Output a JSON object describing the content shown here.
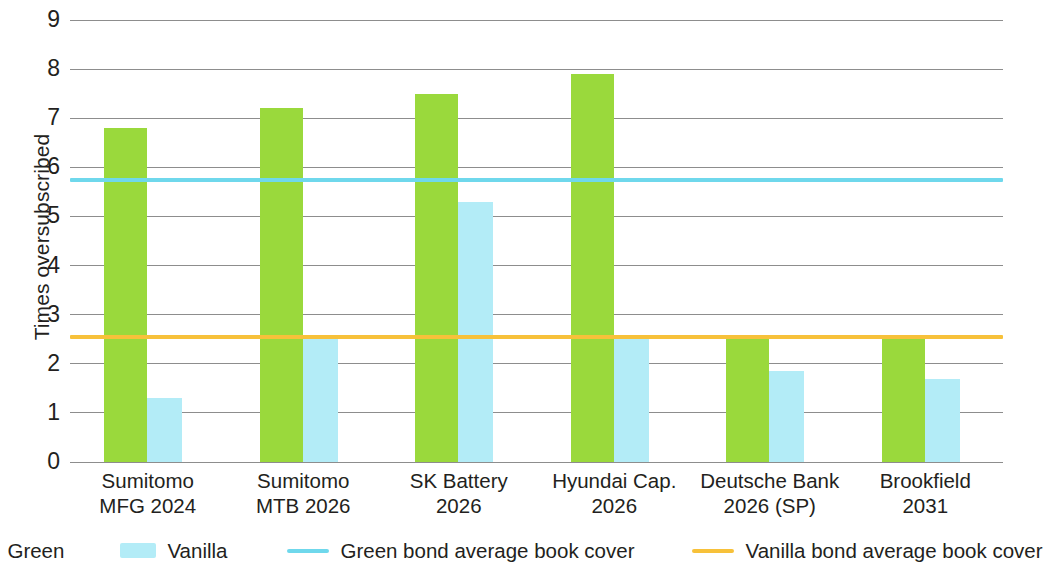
{
  "chart_data": {
    "type": "bar",
    "title": "",
    "subtitle": "",
    "xlabel": "",
    "ylabel": "Times oversubscribed",
    "ylim": [
      0,
      9
    ],
    "ytick_labels": [
      "0",
      "1",
      "2",
      "3",
      "4",
      "5",
      "6",
      "7",
      "8",
      "9"
    ],
    "yticks": [
      0,
      1,
      2,
      3,
      4,
      5,
      6,
      7,
      8,
      9
    ],
    "grid": true,
    "grid_axis": "y",
    "legend_position": "bottom",
    "categories": [
      "Sumitomo MFG 2024",
      "Sumitomo MTB 2026",
      "SK Battery 2026",
      "Hyundai Cap. 2026",
      "Deutsche Bank 2026 (SP)",
      "Brookfield 2031"
    ],
    "category_lines": [
      [
        "Sumitomo",
        "MFG 2024"
      ],
      [
        "Sumitomo",
        "MTB 2026"
      ],
      [
        "SK Battery",
        "2026"
      ],
      [
        "Hyundai Cap.",
        "2026"
      ],
      [
        "Deutsche Bank",
        "2026 (SP)"
      ],
      [
        "Brookfield",
        "2031"
      ]
    ],
    "series": [
      {
        "name": "Green",
        "color": "#9ad93c",
        "type": "bar",
        "values": [
          6.8,
          7.2,
          7.5,
          7.9,
          2.5,
          2.5
        ]
      },
      {
        "name": "Vanilla",
        "color": "#b3ecf7",
        "type": "bar",
        "values": [
          1.3,
          2.5,
          5.3,
          2.5,
          1.85,
          1.7
        ]
      }
    ],
    "reference_lines": [
      {
        "name": "Green bond average book cover",
        "color": "#6fd8ec",
        "value": 5.75
      },
      {
        "name": "Vanilla bond average book cover",
        "color": "#f7c13a",
        "value": 2.55
      }
    ],
    "legend": [
      {
        "label": "Green",
        "marker": "box",
        "color": "#9ad93c"
      },
      {
        "label": "Vanilla",
        "marker": "box",
        "color": "#b3ecf7"
      },
      {
        "label": "Green bond average book cover",
        "marker": "line",
        "color": "#6fd8ec"
      },
      {
        "label": "Vanilla bond average book cover",
        "marker": "line",
        "color": "#f7c13a"
      }
    ]
  }
}
